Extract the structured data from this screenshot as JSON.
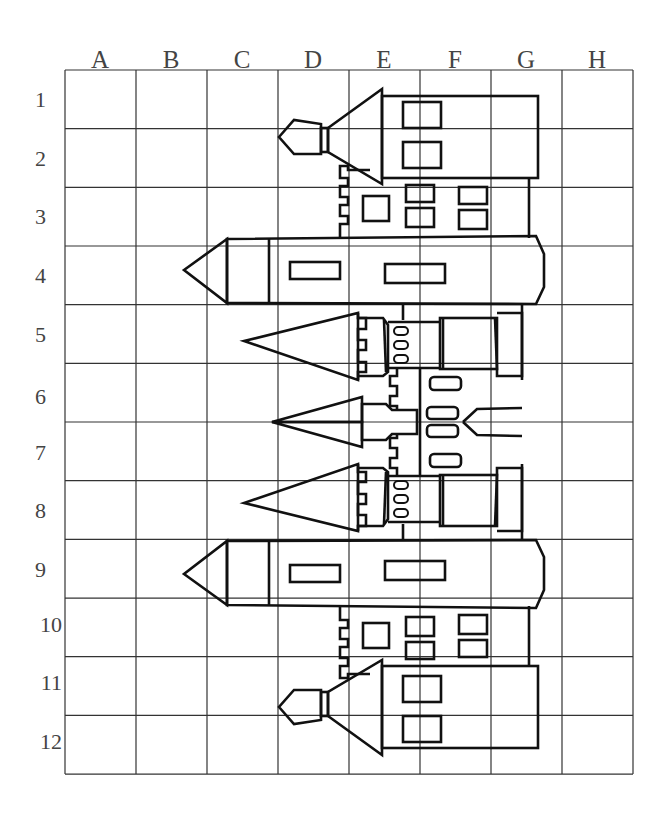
{
  "grid": {
    "columns": [
      "A",
      "B",
      "C",
      "D",
      "E",
      "F",
      "G",
      "H"
    ],
    "rows": [
      "1",
      "2",
      "3",
      "4",
      "5",
      "6",
      "7",
      "8",
      "9",
      "10",
      "11",
      "12"
    ],
    "left": 65,
    "top": 70,
    "cell_width": 71,
    "cell_height": 58.67
  },
  "colors": {
    "line": "#111111",
    "grid": "#333333",
    "label": "#444444",
    "background": "#ffffff"
  }
}
